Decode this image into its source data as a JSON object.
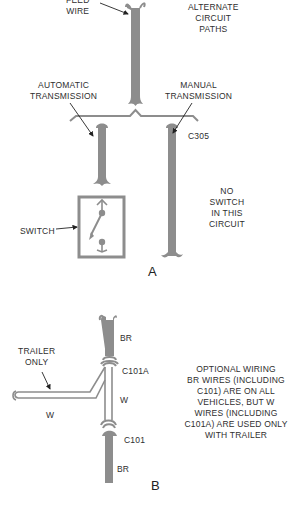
{
  "figure": {
    "colors": {
      "wire": "#8d8d8d",
      "outline": "#8d8d8d",
      "text": "#2e2e2e",
      "background": "#ffffff"
    },
    "panel_a": {
      "letter": "A",
      "labels": {
        "feed_wire_line1": "FEED",
        "feed_wire_line2": "WIRE",
        "alternate_line1": "ALTERNATE",
        "alternate_line2": "CIRCUIT",
        "alternate_line3": "PATHS",
        "automatic_line1": "AUTOMATIC",
        "automatic_line2": "TRANSMISSION",
        "manual_line1": "MANUAL",
        "manual_line2": "TRANSMISSION",
        "connector": "C305",
        "switch": "SWITCH",
        "no_switch_line1": "NO",
        "no_switch_line2": "SWITCH",
        "no_switch_line3": "IN THIS",
        "no_switch_line4": "CIRCUIT"
      }
    },
    "panel_b": {
      "letter": "B",
      "labels": {
        "trailer_line1": "TRAILER",
        "trailer_line2": "ONLY",
        "br_top": "BR",
        "c101a": "C101A",
        "w_vertical": "W",
        "w_horizontal": "W",
        "c101": "C101",
        "br_bottom": "BR"
      },
      "note": [
        "OPTIONAL WIRING",
        "BR WIRES (INCLUDING",
        "C101) ARE ON ALL",
        "VEHICLES, BUT W",
        "WIRES (INCLUDING",
        "C101A) ARE USED ONLY",
        "WITH TRAILER"
      ]
    }
  }
}
